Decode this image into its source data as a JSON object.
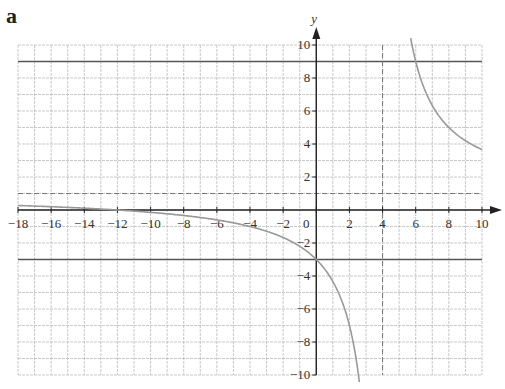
{
  "panel_label": "a",
  "chart_data": {
    "type": "line",
    "title": "",
    "xlabel": "x",
    "ylabel": "y",
    "xlim": [
      -18,
      10
    ],
    "ylim": [
      -10,
      10
    ],
    "grid": true,
    "x_ticks": [
      -18,
      -16,
      -14,
      -12,
      -10,
      -8,
      -6,
      -4,
      -2,
      0,
      2,
      4,
      6,
      8,
      10
    ],
    "y_ticks": [
      -10,
      -8,
      -6,
      -4,
      -2,
      2,
      4,
      6,
      8,
      10
    ],
    "series": [
      {
        "name": "curve",
        "function": "y = 1 + 16/(x - 4)",
        "x": [
          -18,
          -14,
          -10,
          -6,
          -4,
          -2,
          0,
          1,
          2,
          2.6,
          5.7,
          6,
          7,
          8,
          9,
          10
        ],
        "y": [
          0.27,
          0.11,
          -0.14,
          -0.6,
          -1,
          -1.67,
          -3,
          -4.33,
          -7,
          -10.4,
          10.4,
          9,
          6.33,
          5,
          4.2,
          3.67
        ]
      },
      {
        "name": "horizontal line y=9",
        "y_value": 9
      },
      {
        "name": "horizontal line y=-3",
        "y_value": -3
      },
      {
        "name": "horizontal asymptote (dashed)",
        "y_value": 1
      },
      {
        "name": "vertical asymptote (dashed)",
        "x_value": 4
      }
    ],
    "legend": null
  }
}
